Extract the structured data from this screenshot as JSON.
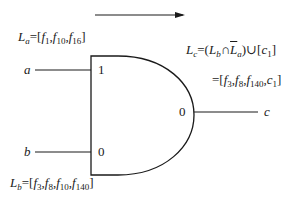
{
  "diagram": {
    "type": "AND gate fault list propagation",
    "direction_arrow": "right-arrow",
    "inputs": [
      {
        "name": "a",
        "value": "1",
        "fault_list_label": "L",
        "fault_list_sub": "a",
        "fault_list": [
          "f1",
          "f10",
          "f16"
        ]
      },
      {
        "name": "b",
        "value": "0",
        "fault_list_label": "L",
        "fault_list_sub": "b",
        "fault_list": [
          "f3",
          "f8",
          "f10",
          "f140"
        ]
      }
    ],
    "output": {
      "name": "c",
      "value": "0",
      "fault_list_label": "L",
      "fault_list_sub": "c",
      "formula": "(Lb ∩ L̄a) ∪ [c1]",
      "result": [
        "f3",
        "f8",
        "f140",
        "c1"
      ]
    }
  },
  "labels": {
    "a": "a",
    "b": "b",
    "c": "c",
    "a_val": "1",
    "b_val": "0",
    "c_val": "0",
    "L": "L",
    "sub_a": "a",
    "sub_b": "b",
    "sub_c": "c",
    "f": "f",
    "c1_c": "c",
    "n1": "1",
    "n3": "3",
    "n8": "8",
    "n10": "10",
    "n16": "16",
    "n140": "140",
    "eq": "=",
    "lb": "[",
    "rb": "]",
    "comma": ",",
    "lp": "(",
    "rp": ")",
    "cap": "∩",
    "cup": "∪"
  }
}
